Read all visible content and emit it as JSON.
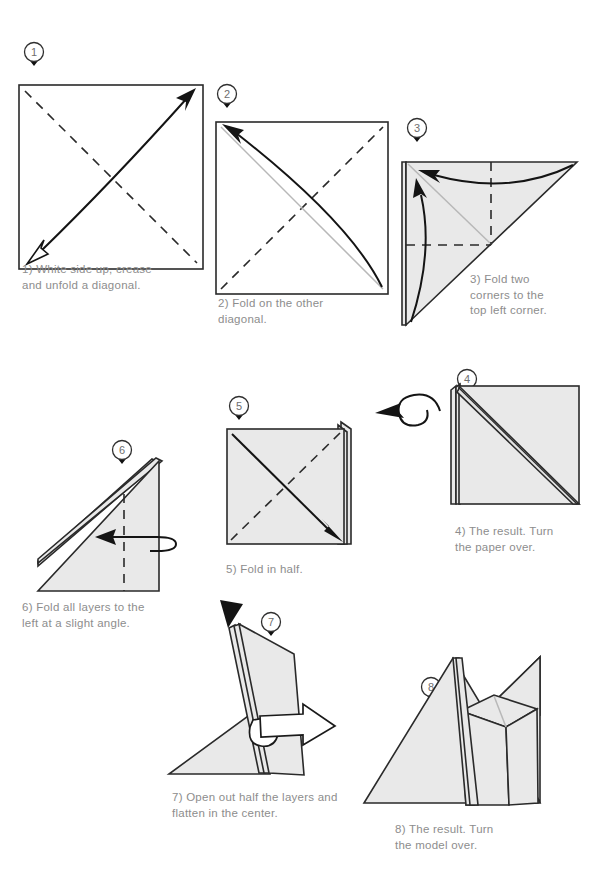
{
  "document": {
    "title": "Origami folding instructions",
    "page_background": "#ffffff",
    "caption_color": "#8d8d8d",
    "paper_fill_shaded": "#e9e9e9",
    "paper_fill_white": "#ffffff",
    "line_color": "#2a2a2a"
  },
  "steps": [
    {
      "number": "1",
      "badge_label": "1",
      "caption": "1) White side up, crease\nand unfold a diagonal.",
      "diagram_kind": "square-white-with-double-arrow"
    },
    {
      "number": "2",
      "badge_label": "2",
      "caption": "2) Fold on the other\ndiagonal.",
      "diagram_kind": "square-white-with-curved-fold-arrow"
    },
    {
      "number": "3",
      "badge_label": "3",
      "caption": "3) Fold two\ncorners to the\ntop left corner.",
      "diagram_kind": "triangle-two-corner-folds"
    },
    {
      "number": "4",
      "badge_label": "4",
      "caption": "4) The result. Turn\nthe paper over.",
      "diagram_kind": "square-folded-result-turn-over"
    },
    {
      "number": "5",
      "badge_label": "5",
      "caption": "5) Fold in half.",
      "diagram_kind": "square-layers-fold-in-half"
    },
    {
      "number": "6",
      "badge_label": "6",
      "caption": "6) Fold all layers to the\nleft at a slight angle.",
      "diagram_kind": "right-triangle-fold-left"
    },
    {
      "number": "7",
      "badge_label": "7",
      "caption": "7) Open out half the layers and\nflatten in the center.",
      "diagram_kind": "open-out-layers"
    },
    {
      "number": "8",
      "badge_label": "8",
      "caption": "8) The result. Turn\nthe model over.",
      "diagram_kind": "result-turn-model-over"
    }
  ],
  "symbols": {
    "turn_over_icon": "circular-turn-arrow",
    "open_out_icon": "hollow-push-arrow",
    "valley_fold": "dashed-line",
    "fold_direction": "solid-arrow"
  }
}
